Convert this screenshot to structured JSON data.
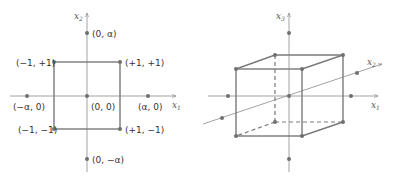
{
  "colors": {
    "axis": "#8a8a8a",
    "shape": "#7a7a7a",
    "point": "#6f6f6f",
    "text": "#333333"
  },
  "left_panel": {
    "axis_x_label": "x",
    "axis_x_sub": "1",
    "axis_y_label": "x",
    "axis_y_sub": "2",
    "points": {
      "top_axial": "(0, α)",
      "bottom_axial": "(0, −α)",
      "left_axial": "(−α, 0)",
      "right_axial": "(α, 0)",
      "center": "(0, 0)",
      "top_left": "(−1, +1)",
      "top_right": "(+1, +1)",
      "bottom_left": "(−1, −1)",
      "bottom_right": "(+1, −1)"
    }
  },
  "right_panel": {
    "axis_x1_label": "x",
    "axis_x1_sub": "1",
    "axis_x2_label": "x",
    "axis_x2_sub": "2",
    "axis_x3_label": "x",
    "axis_x3_sub": "3"
  }
}
